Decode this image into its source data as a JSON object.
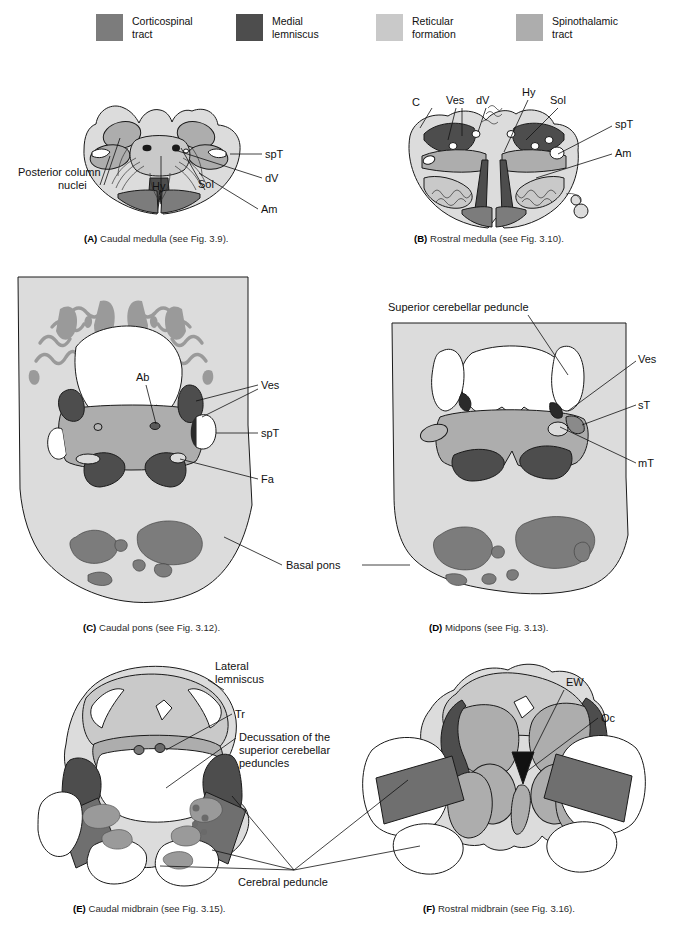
{
  "figure": {
    "title_implicit": "Brainstem cross-sections: tracts and nuclei"
  },
  "colors": {
    "corticospinal_tract": "#7c7c7c",
    "medial_lemniscus": "#4d4d4d",
    "reticular_formation": "#c9c9c9",
    "spinothalamic_tract": "#adadad",
    "background_tissue": "#dcdcdc",
    "white_matter": "#ffffff",
    "outline": "#1a1a1a",
    "text": "#111111"
  },
  "legend": {
    "items": [
      {
        "label": "Corticospinal\ntract",
        "color": "#7c7c7c",
        "swatch_name": "legend-swatch-corticospinal"
      },
      {
        "label": "Medial\nlemniscus",
        "color": "#4d4d4d",
        "swatch_name": "legend-swatch-medial-lemniscus"
      },
      {
        "label": "Reticular\nformation",
        "color": "#c9c9c9",
        "swatch_name": "legend-swatch-reticular"
      },
      {
        "label": "Spinothalamic\ntract",
        "color": "#adadad",
        "swatch_name": "legend-swatch-spinothalamic"
      }
    ]
  },
  "panels": {
    "a": {
      "id": "A",
      "caption_prefix": "(A)",
      "caption_text": "Caudal medulla (see Fig. 3.9).",
      "labels": {
        "posterior_column_nuclei": "Posterior column\nnuclei",
        "posterior_column_nuclei_line1": "Posterior column",
        "posterior_column_nuclei_line2": "nuclei",
        "hy": "Hy",
        "sol": "Sol",
        "spt": "spT",
        "dv": "dV",
        "am": "Am"
      }
    },
    "b": {
      "id": "B",
      "caption_prefix": "(B)",
      "caption_text": "Rostral medulla (see Fig. 3.10).",
      "labels": {
        "c": "C",
        "ves": "Ves",
        "dv": "dV",
        "hy": "Hy",
        "sol": "Sol",
        "spt": "spT",
        "am": "Am"
      }
    },
    "c": {
      "id": "C",
      "caption_prefix": "(C)",
      "caption_text": "Caudal pons (see Fig. 3.12).",
      "labels": {
        "ab": "Ab",
        "ves": "Ves",
        "spt": "spT",
        "fa": "Fa",
        "basal_pons": "Basal pons"
      }
    },
    "d": {
      "id": "D",
      "caption_prefix": "(D)",
      "caption_text": "Midpons (see Fig. 3.13).",
      "labels": {
        "superior_cerebellar_peduncle": "Superior cerebellar peduncle",
        "ves": "Ves",
        "st": "sT",
        "mt": "mT"
      }
    },
    "e": {
      "id": "E",
      "caption_prefix": "(E)",
      "caption_text": "Caudal midbrain (see Fig. 3.15).",
      "labels": {
        "lateral_lemniscus_line1": "Lateral",
        "lateral_lemniscus_line2": "lemniscus",
        "tr": "Tr",
        "decussation_line1": "Decussation of the",
        "decussation_line2": "superior cerebellar",
        "decussation_line3": "peduncles",
        "cerebral_peduncle": "Cerebral peduncle"
      }
    },
    "f": {
      "id": "F",
      "caption_prefix": "(F)",
      "caption_text": "Rostral midbrain (see Fig. 3.16).",
      "labels": {
        "ew": "EW",
        "oc": "Oc"
      }
    }
  }
}
